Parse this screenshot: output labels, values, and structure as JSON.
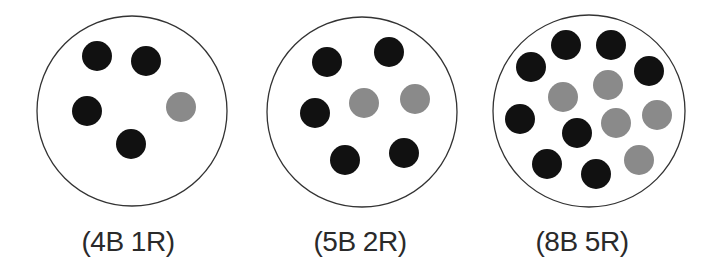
{
  "diagram": {
    "type": "marble-jars",
    "colors": {
      "background": "#ffffff",
      "jar_outline": "#333333",
      "black_marble": "#111111",
      "red_marble": "#8a8a8a"
    },
    "marble_radius": 15,
    "jars": [
      {
        "label": "(4B 1R)",
        "black_count": 4,
        "red_count": 1,
        "center": [
          132,
          111
        ],
        "radius": 95,
        "label_x": 128,
        "marbles": [
          {
            "x": 97,
            "y": 56,
            "color": "black"
          },
          {
            "x": 146,
            "y": 61,
            "color": "black"
          },
          {
            "x": 87,
            "y": 111,
            "color": "black"
          },
          {
            "x": 181,
            "y": 107,
            "color": "red"
          },
          {
            "x": 131,
            "y": 144,
            "color": "black"
          }
        ]
      },
      {
        "label": "(5B 2R)",
        "black_count": 5,
        "red_count": 2,
        "center": [
          362,
          112
        ],
        "radius": 95,
        "label_x": 360,
        "marbles": [
          {
            "x": 327,
            "y": 62,
            "color": "black"
          },
          {
            "x": 389,
            "y": 52,
            "color": "black"
          },
          {
            "x": 315,
            "y": 113,
            "color": "black"
          },
          {
            "x": 364,
            "y": 103,
            "color": "red"
          },
          {
            "x": 415,
            "y": 99,
            "color": "red"
          },
          {
            "x": 345,
            "y": 160,
            "color": "black"
          },
          {
            "x": 404,
            "y": 153,
            "color": "black"
          }
        ]
      },
      {
        "label": "(8B 5R)",
        "black_count": 8,
        "red_count": 5,
        "center": [
          589,
          111
        ],
        "radius": 96,
        "label_x": 582,
        "marbles": [
          {
            "x": 566,
            "y": 45,
            "color": "black"
          },
          {
            "x": 611,
            "y": 45,
            "color": "black"
          },
          {
            "x": 531,
            "y": 67,
            "color": "black"
          },
          {
            "x": 649,
            "y": 71,
            "color": "black"
          },
          {
            "x": 563,
            "y": 97,
            "color": "red"
          },
          {
            "x": 608,
            "y": 85,
            "color": "red"
          },
          {
            "x": 520,
            "y": 119,
            "color": "black"
          },
          {
            "x": 577,
            "y": 133,
            "color": "black"
          },
          {
            "x": 616,
            "y": 123,
            "color": "red"
          },
          {
            "x": 657,
            "y": 115,
            "color": "red"
          },
          {
            "x": 547,
            "y": 164,
            "color": "black"
          },
          {
            "x": 596,
            "y": 174,
            "color": "black"
          },
          {
            "x": 639,
            "y": 160,
            "color": "red"
          }
        ]
      }
    ]
  }
}
